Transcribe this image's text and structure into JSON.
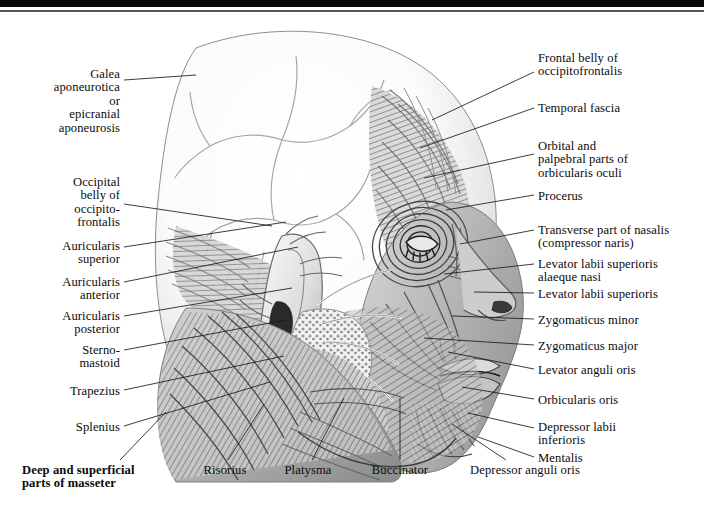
{
  "plate": {
    "subject": "Muscles of the face and scalp — lateral view",
    "style": "grayscale pencil / halftone engraving",
    "width": 704,
    "height": 519,
    "background": "#ffffff",
    "ink": "#0a0a0a"
  },
  "scan_edge": {
    "dark_bar_color": "#090909",
    "thin_line_color": "#555555"
  },
  "labels_left": [
    {
      "id": "galea-aponeurotica",
      "text": "Galea\naponeurotica\nor\nepicranial\naponeurosis",
      "x": 8,
      "y": 68,
      "w": 112,
      "align": "right",
      "bold": false,
      "leader": {
        "x1": 124,
        "y1": 80,
        "x2": 196,
        "y2": 75
      }
    },
    {
      "id": "occipital-belly-of-occipitofrontalis",
      "text": "Occipital\nbelly of\noccipito-\nfrontalis",
      "x": 12,
      "y": 176,
      "w": 108,
      "align": "right",
      "bold": false,
      "leader": {
        "x1": 124,
        "y1": 204,
        "x2": 272,
        "y2": 226
      }
    },
    {
      "id": "auricularis-superior",
      "text": "Auricularis\nsuperior",
      "x": 8,
      "y": 240,
      "w": 112,
      "align": "right",
      "bold": false,
      "leader": {
        "x1": 124,
        "y1": 247,
        "x2": 286,
        "y2": 222
      }
    },
    {
      "id": "auricularis-anterior",
      "text": "Auricularis\nanterior",
      "x": 8,
      "y": 276,
      "w": 112,
      "align": "right",
      "bold": false,
      "leader": {
        "x1": 124,
        "y1": 282,
        "x2": 298,
        "y2": 247
      }
    },
    {
      "id": "auricularis-posterior",
      "text": "Auricularis\nposterior",
      "x": 8,
      "y": 310,
      "w": 112,
      "align": "right",
      "bold": false,
      "leader": {
        "x1": 124,
        "y1": 316,
        "x2": 292,
        "y2": 288
      }
    },
    {
      "id": "sterno-mastoid",
      "text": "Sterno-\nmastoid",
      "x": 30,
      "y": 344,
      "w": 90,
      "align": "right",
      "bold": false,
      "leader": {
        "x1": 124,
        "y1": 350,
        "x2": 286,
        "y2": 320
      }
    },
    {
      "id": "trapezius",
      "text": "Trapezius",
      "x": 28,
      "y": 385,
      "w": 92,
      "align": "right",
      "bold": false,
      "leader": {
        "x1": 124,
        "y1": 390,
        "x2": 284,
        "y2": 356
      }
    },
    {
      "id": "splenius",
      "text": "Splenius",
      "x": 34,
      "y": 421,
      "w": 86,
      "align": "right",
      "bold": false,
      "leader": {
        "x1": 124,
        "y1": 426,
        "x2": 270,
        "y2": 382
      }
    }
  ],
  "labels_right": [
    {
      "id": "frontal-belly-of-occipitofrontalis",
      "text": "Frontal belly of\noccipitofrontalis",
      "x": 538,
      "y": 52,
      "w": 160,
      "align": "left",
      "bold": false,
      "leader": {
        "x1": 534,
        "y1": 72,
        "x2": 432,
        "y2": 120
      }
    },
    {
      "id": "temporal-fascia",
      "text": "Temporal fascia",
      "x": 538,
      "y": 102,
      "w": 160,
      "align": "left",
      "bold": false,
      "leader": {
        "x1": 534,
        "y1": 108,
        "x2": 420,
        "y2": 148
      }
    },
    {
      "id": "orbital-and-palpebral-parts-of-orbicularis-oculi",
      "text": "Orbital and\npalpebral parts of\norbicularis oculi",
      "x": 538,
      "y": 140,
      "w": 162,
      "align": "left",
      "bold": false,
      "leader": {
        "x1": 534,
        "y1": 154,
        "x2": 424,
        "y2": 178
      }
    },
    {
      "id": "procerus",
      "text": "Procerus",
      "x": 538,
      "y": 190,
      "w": 160,
      "align": "left",
      "bold": false,
      "leader": {
        "x1": 534,
        "y1": 195,
        "x2": 446,
        "y2": 210
      }
    },
    {
      "id": "transverse-part-of-nasalis",
      "text": "Transverse part of nasalis\n(compressor naris)",
      "x": 538,
      "y": 224,
      "w": 164,
      "align": "left",
      "bold": false,
      "leader": {
        "x1": 534,
        "y1": 230,
        "x2": 460,
        "y2": 244
      }
    },
    {
      "id": "levator-labii-superioris-alaeque-nasi",
      "text": "Levator labii superioris\nalaeque nasi",
      "x": 538,
      "y": 258,
      "w": 164,
      "align": "left",
      "bold": false,
      "leader": {
        "x1": 534,
        "y1": 264,
        "x2": 444,
        "y2": 274
      }
    },
    {
      "id": "levator-labii-superioris",
      "text": "Levator labii superioris",
      "x": 538,
      "y": 288,
      "w": 164,
      "align": "left",
      "bold": false,
      "leader": {
        "x1": 534,
        "y1": 293,
        "x2": 474,
        "y2": 292
      }
    },
    {
      "id": "zygomaticus-minor",
      "text": "Zygomaticus minor",
      "x": 538,
      "y": 314,
      "w": 164,
      "align": "left",
      "bold": false,
      "leader": {
        "x1": 534,
        "y1": 319,
        "x2": 452,
        "y2": 316
      }
    },
    {
      "id": "zygomaticus-major",
      "text": "Zygomaticus major",
      "x": 538,
      "y": 340,
      "w": 164,
      "align": "left",
      "bold": false,
      "leader": {
        "x1": 534,
        "y1": 345,
        "x2": 424,
        "y2": 338
      }
    },
    {
      "id": "levator-anguli-oris",
      "text": "Levator anguli oris",
      "x": 538,
      "y": 364,
      "w": 164,
      "align": "left",
      "bold": false,
      "leader": {
        "x1": 534,
        "y1": 369,
        "x2": 448,
        "y2": 352
      }
    },
    {
      "id": "orbicularis-oris",
      "text": "Orbicularis oris",
      "x": 538,
      "y": 394,
      "w": 164,
      "align": "left",
      "bold": false,
      "leader": {
        "x1": 534,
        "y1": 399,
        "x2": 462,
        "y2": 387
      }
    },
    {
      "id": "depressor-labii-inferioris",
      "text": "Depressor labii\ninferioris",
      "x": 538,
      "y": 421,
      "w": 164,
      "align": "left",
      "bold": false,
      "leader": {
        "x1": 534,
        "y1": 428,
        "x2": 468,
        "y2": 413
      }
    },
    {
      "id": "mentalis",
      "text": "Mentalis",
      "x": 538,
      "y": 452,
      "w": 164,
      "align": "left",
      "bold": false,
      "leader": {
        "x1": 534,
        "y1": 457,
        "x2": 478,
        "y2": 437
      }
    }
  ],
  "labels_bottom": [
    {
      "id": "deep-and-superficial-parts-of-masseter",
      "text": "Deep and superficial\nparts of masseter",
      "x": 22,
      "y": 464,
      "w": 160,
      "align": "left",
      "bold": true,
      "leader": {
        "x1": 120,
        "y1": 460,
        "x2": 166,
        "y2": 412
      }
    },
    {
      "id": "risorius",
      "text": "Risorius",
      "x": 186,
      "y": 464,
      "w": 78,
      "align": "center",
      "bold": false,
      "leader": {
        "x1": 228,
        "y1": 460,
        "x2": 264,
        "y2": 404
      }
    },
    {
      "id": "platysma",
      "text": "Platysma",
      "x": 268,
      "y": 464,
      "w": 80,
      "align": "center",
      "bold": false,
      "leader": {
        "x1": 312,
        "y1": 460,
        "x2": 344,
        "y2": 398
      }
    },
    {
      "id": "buccinator",
      "text": "Buccinator",
      "x": 355,
      "y": 464,
      "w": 90,
      "align": "center",
      "bold": false,
      "leader": {
        "x1": 400,
        "y1": 460,
        "x2": 400,
        "y2": 398
      }
    },
    {
      "id": "depressor-anguli-oris",
      "text": "Depressor anguli oris",
      "x": 450,
      "y": 464,
      "w": 150,
      "align": "center",
      "bold": false,
      "leader": {
        "x1": 506,
        "y1": 460,
        "x2": 452,
        "y2": 424
      }
    }
  ]
}
